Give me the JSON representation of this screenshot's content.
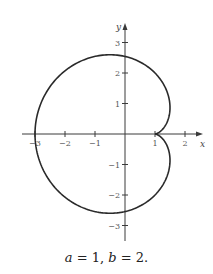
{
  "chart_data": {
    "type": "line",
    "title": "",
    "caption": "a = 1, b = 2.",
    "xlabel": "x",
    "ylabel": "y",
    "xlim": [
      -3.3,
      2.5
    ],
    "ylim": [
      -3.5,
      3.6
    ],
    "grid": false,
    "x_ticks": [
      -3,
      -2,
      -1,
      1,
      2
    ],
    "x_tick_labels": [
      "−3",
      "−2",
      "−1",
      "1",
      "2"
    ],
    "y_ticks": [
      3,
      2,
      1,
      -1,
      -2,
      -3
    ],
    "y_tick_labels": [
      "3",
      "2",
      "1",
      "−1",
      "−2",
      "−3"
    ],
    "parameters": {
      "a": 1,
      "b": 2
    },
    "series": [
      {
        "name": "cardioid (cusp at (1,0))",
        "description": "x = a + b(1 − cos t)cos t, y = b(1 − cos t)sin t",
        "points": [
          {
            "x": 1.0,
            "y": 0.0
          },
          {
            "x": 1.5,
            "y": 0.87
          },
          {
            "x": 1.0,
            "y": 2.0
          },
          {
            "x": -0.5,
            "y": 2.6
          },
          {
            "x": -2.0,
            "y": 1.73
          },
          {
            "x": -3.0,
            "y": 0.0
          },
          {
            "x": -2.0,
            "y": -1.73
          },
          {
            "x": -0.5,
            "y": -2.6
          },
          {
            "x": 1.0,
            "y": -2.0
          },
          {
            "x": 1.5,
            "y": -0.87
          },
          {
            "x": 1.0,
            "y": 0.0
          }
        ]
      }
    ]
  },
  "caption": {
    "a_var": "a",
    "a_val": " = 1, ",
    "b_var": "b",
    "b_val": " = 2."
  },
  "axes": {
    "x_name": "x",
    "y_name": "y"
  }
}
